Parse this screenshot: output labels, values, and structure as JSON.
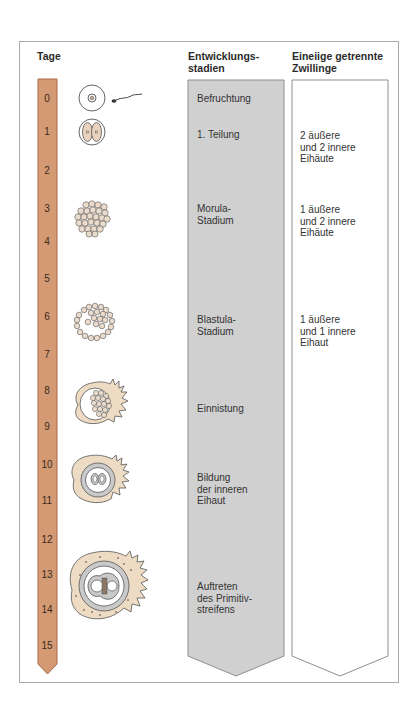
{
  "headers": {
    "days": "Tage",
    "stages_line1": "Entwicklungs-",
    "stages_line2": "stadien",
    "twins_line1": "Eineiige getrennte",
    "twins_line2": "Zwillinge"
  },
  "days": [
    "0",
    "1",
    "2",
    "3",
    "4",
    "5",
    "6",
    "7",
    "8",
    "9",
    "10",
    "11",
    "12",
    "13",
    "14",
    "15"
  ],
  "stages": [
    {
      "line1": "Befruchtung"
    },
    {
      "line1": "1. Teilung"
    },
    {
      "line1": "Morula-",
      "line2": "Stadium"
    },
    {
      "line1": "Blastula-",
      "line2": "Stadium"
    },
    {
      "line1": "Einnistung"
    },
    {
      "line1": "Bildung",
      "line2": "der inneren",
      "line3": "Eihaut"
    },
    {
      "line1": "Auftreten",
      "line2": "des Primitiv-",
      "line3": "streifens"
    }
  ],
  "twins": [
    {
      "line1": "2 äußere",
      "line2": "und 2 innere",
      "line3": "Eihäute"
    },
    {
      "line1": "1 äußere",
      "line2": "und 2 innere",
      "line3": "Eihäute"
    },
    {
      "line1": "1 äußere",
      "line2": "und 1 innere",
      "line3": "Eihaut"
    }
  ],
  "illustrations": [
    "zygote-with-sperm",
    "two-cell-stage",
    "morula",
    "blastula",
    "implantation",
    "inner-membrane-formation",
    "primitive-streak"
  ],
  "colors": {
    "day_bar": "#d49a74",
    "stage_column": "#d0d0d0",
    "twin_column": "#ffffff",
    "tissue": "#eed9bf",
    "membrane": "#c8c8c8"
  }
}
